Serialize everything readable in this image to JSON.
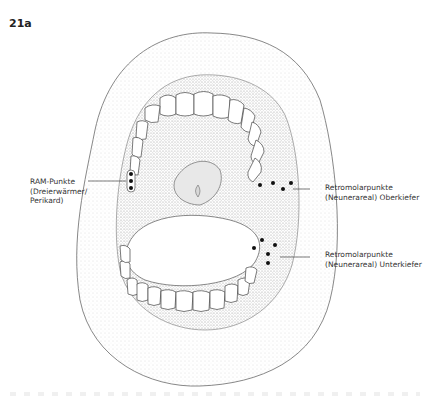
{
  "figure": {
    "label": "21a"
  },
  "annotations": [
    {
      "id": "ram",
      "lines": [
        "RAM-Punkte",
        "(Dreierwärmer/",
        "Perikard)"
      ]
    },
    {
      "id": "retro-upper",
      "lines": [
        "Retromolarpunkte",
        "(Neunerareal) Oberkiefer"
      ]
    },
    {
      "id": "retro-lower",
      "lines": [
        "Retromolarpunkte",
        "(Neunerareal) Unterkiefer"
      ]
    }
  ],
  "points": {
    "ram": [
      [
        131,
        174
      ],
      [
        131,
        181
      ],
      [
        131,
        188
      ]
    ],
    "retro_upper": [
      [
        260,
        185
      ],
      [
        273,
        183
      ],
      [
        283,
        189
      ],
      [
        291,
        183
      ]
    ],
    "retro_lower": [
      [
        254,
        248
      ],
      [
        262,
        240
      ],
      [
        268,
        254
      ],
      [
        275,
        245
      ],
      [
        268,
        263
      ]
    ]
  },
  "colors": {
    "ink": "#333333",
    "stipple": "#bdbdbd",
    "point": "#111111"
  }
}
